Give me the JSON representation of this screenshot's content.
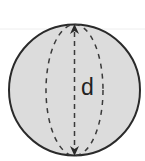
{
  "diagram": {
    "shape": "sphere",
    "label": "d",
    "label_meaning": "diameter",
    "colors": {
      "fill": "#dcdcdc",
      "outline": "#2a2a2a",
      "dash": "#3a3a3a",
      "text": "#222222",
      "background": "#ffffff"
    }
  }
}
